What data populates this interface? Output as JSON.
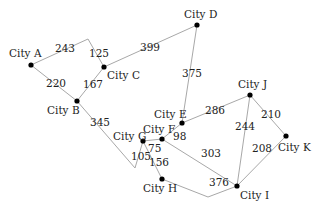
{
  "diagram": {
    "type": "weighted-graph",
    "nodes": [
      {
        "id": "A",
        "label": "City A",
        "x": 31,
        "y": 65,
        "lx": 9,
        "ly": 57
      },
      {
        "id": "B",
        "label": "City B",
        "x": 77,
        "y": 101,
        "lx": 47,
        "ly": 114
      },
      {
        "id": "C",
        "label": "City C",
        "x": 104,
        "y": 67,
        "lx": 107,
        "ly": 79
      },
      {
        "id": "D",
        "label": "City D",
        "x": 197,
        "y": 25,
        "lx": 184,
        "ly": 18
      },
      {
        "id": "E",
        "label": "City E",
        "x": 182,
        "y": 123,
        "lx": 154,
        "ly": 118
      },
      {
        "id": "F",
        "label": "City F",
        "x": 162,
        "y": 139,
        "lx": 143,
        "ly": 133
      },
      {
        "id": "G",
        "label": "City G",
        "x": 143,
        "y": 141,
        "lx": 113,
        "ly": 140
      },
      {
        "id": "H",
        "label": "City H",
        "x": 162,
        "y": 179,
        "lx": 143,
        "ly": 192
      },
      {
        "id": "I",
        "label": "City I",
        "x": 237,
        "y": 186,
        "lx": 240,
        "ly": 199
      },
      {
        "id": "J",
        "label": "City J",
        "x": 250,
        "y": 95,
        "lx": 238,
        "ly": 88
      },
      {
        "id": "K",
        "label": "City K",
        "x": 286,
        "y": 136,
        "lx": 278,
        "ly": 151
      }
    ],
    "edges": [
      {
        "from": "A",
        "to": "C",
        "weight": "243",
        "path": "31,65 88,39",
        "wx": 55,
        "wy": 52
      },
      {
        "from": "A",
        "to": "C",
        "weight": "125",
        "path": "88,39 104,67",
        "wx": 89,
        "wy": 57
      },
      {
        "from": "A",
        "to": "B",
        "weight": "220",
        "path": "31,65 77,101",
        "wx": 46,
        "wy": 87
      },
      {
        "from": "B",
        "to": "C",
        "weight": "167",
        "path": "77,101 104,67",
        "wx": 83,
        "wy": 88
      },
      {
        "from": "C",
        "to": "D",
        "weight": "399",
        "path": "104,67 197,25",
        "wx": 140,
        "wy": 51
      },
      {
        "from": "D",
        "to": "E",
        "weight": "375",
        "path": "197,25 182,123",
        "wx": 182,
        "wy": 77
      },
      {
        "from": "B",
        "to": "G",
        "weight": "345",
        "path": "77,101 135,168 143,141",
        "wx": 90,
        "wy": 126
      },
      {
        "from": "G",
        "to": "G",
        "weight": "105",
        "path": "",
        "wx": 131,
        "wy": 160
      },
      {
        "from": "G",
        "to": "F",
        "weight": "75",
        "path": "143,141 162,139",
        "wx": 148,
        "wy": 152
      },
      {
        "from": "F",
        "to": "E",
        "weight": "98",
        "path": "162,139 182,123",
        "wx": 173,
        "wy": 140
      },
      {
        "from": "E",
        "to": "J",
        "weight": "286",
        "path": "182,123 250,95",
        "wx": 205,
        "wy": 114
      },
      {
        "from": "G",
        "to": "H",
        "weight": "156",
        "path": "143,141 162,179",
        "wx": 149,
        "wy": 166
      },
      {
        "from": "F",
        "to": "I",
        "weight": "303",
        "path": "162,139 237,186",
        "wx": 201,
        "wy": 157
      },
      {
        "from": "H",
        "to": "I",
        "weight": "376",
        "path": "162,179 208,197 237,186",
        "wx": 209,
        "wy": 186
      },
      {
        "from": "J",
        "to": "I",
        "weight": "244",
        "path": "250,95 237,186",
        "wx": 235,
        "wy": 130
      },
      {
        "from": "J",
        "to": "K",
        "weight": "210",
        "path": "250,95 286,136",
        "wx": 261,
        "wy": 118
      },
      {
        "from": "I",
        "to": "K",
        "weight": "208",
        "path": "237,186 286,136",
        "wx": 252,
        "wy": 152
      }
    ]
  }
}
